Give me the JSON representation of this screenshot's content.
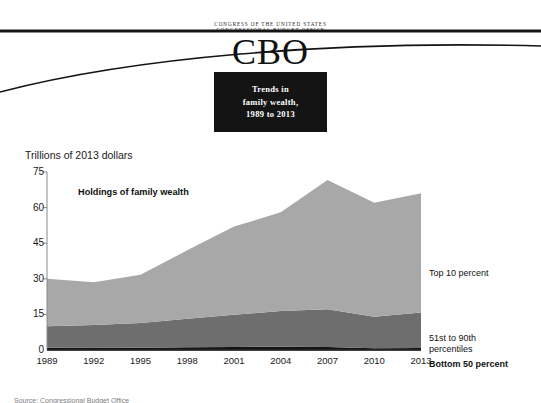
{
  "masthead": {
    "agency_lines": "CONGRESS OF THE UNITED STATES\nCONGRESSIONAL BUDGET OFFICE",
    "wordmark": "CBO",
    "title_line_1": "Trends in",
    "title_line_2": "family wealth,",
    "title_line_3": "1989 to 2013"
  },
  "chart_data": {
    "type": "area",
    "title": "Holdings of family wealth",
    "ylabel": "Trillions of 2013 dollars",
    "xlabel": "",
    "ylim": [
      0,
      75
    ],
    "yticks": [
      0,
      15,
      30,
      45,
      60,
      75
    ],
    "ytick_labels": [
      "0",
      "15",
      "30",
      "45",
      "60",
      "75"
    ],
    "xlim": [
      1989,
      2013
    ],
    "xticks": [
      1989,
      1992,
      1995,
      1998,
      2001,
      2004,
      2007,
      2010,
      2013
    ],
    "xtick_labels": [
      "1989",
      "1992",
      "1995",
      "1998",
      "2001",
      "2004",
      "2007",
      "2010",
      "2013"
    ],
    "grid": false,
    "legend_position": "right-inline",
    "stacked": true,
    "x": [
      1989,
      1992,
      1995,
      1998,
      2001,
      2004,
      2007,
      2010,
      2013
    ],
    "series": [
      {
        "name": "Bottom 50 percent",
        "label": "Bottom 50 percent",
        "color": "#141414",
        "values": [
          1.0,
          1.1,
          1.0,
          1.2,
          1.3,
          1.4,
          1.3,
          0.7,
          0.8
        ]
      },
      {
        "name": "51st to 90th percentiles",
        "label": "51st to 90th\npercentiles",
        "color": "#6e6e6e",
        "values": [
          9.0,
          9.4,
          10.4,
          12.0,
          13.5,
          15.0,
          15.9,
          13.3,
          15.0
        ]
      },
      {
        "name": "Top 10 percent",
        "label": "Top 10 percent",
        "color": "#a8a8a8",
        "values": [
          20.0,
          18.0,
          20.3,
          28.8,
          37.2,
          41.6,
          54.4,
          48.0,
          50.2
        ]
      }
    ],
    "totals": [
      30.0,
      28.5,
      31.7,
      42.0,
      52.0,
      58.0,
      71.6,
      62.0,
      66.0
    ]
  },
  "source_note": "Source: Congressional Budget Office"
}
